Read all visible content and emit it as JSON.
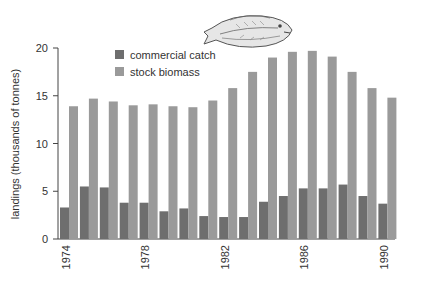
{
  "chart_data": {
    "type": "bar",
    "title": "",
    "xlabel": "",
    "ylabel": "landings (thousands of tonnes)",
    "ylim": [
      0,
      20
    ],
    "yticks": [
      0,
      5,
      10,
      15,
      20
    ],
    "grid": false,
    "legend_position": "top-left inside",
    "categories": [
      "1974",
      "1975",
      "1976",
      "1977",
      "1978",
      "1979",
      "1980",
      "1981",
      "1982",
      "1983",
      "1984",
      "1985",
      "1986",
      "1987",
      "1988",
      "1989",
      "1990"
    ],
    "xtick_labels": [
      "1974",
      "1978",
      "1982",
      "1986",
      "1990"
    ],
    "series": [
      {
        "name": "commercial catch",
        "color": "#6e6e6e",
        "values": [
          3.3,
          5.5,
          5.4,
          3.8,
          3.8,
          2.9,
          3.2,
          2.4,
          2.3,
          2.3,
          3.9,
          4.5,
          5.3,
          5.3,
          5.7,
          4.5,
          3.7
        ]
      },
      {
        "name": "stock biomass",
        "color": "#9a9a9a",
        "values": [
          13.9,
          14.7,
          14.4,
          14.0,
          14.1,
          13.9,
          13.8,
          14.5,
          15.8,
          17.5,
          19.0,
          19.6,
          19.7,
          19.1,
          17.5,
          15.8,
          14.8
        ]
      }
    ],
    "annotations": [
      {
        "type": "image",
        "description": "fish illustration",
        "icon": "fish-icon"
      }
    ]
  }
}
